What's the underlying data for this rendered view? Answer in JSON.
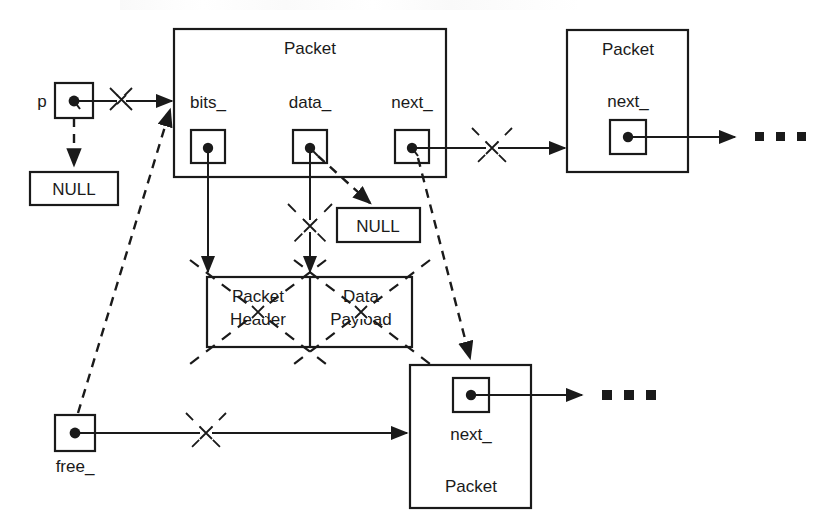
{
  "diagram": {
    "stroke_color": "#1a1a1a",
    "background_color": "#ffffff"
  },
  "labels": {
    "p": "p",
    "null_left": "NULL",
    "null_data": "NULL",
    "free": "free_",
    "packet_main": "Packet",
    "packet_top_right": "Packet",
    "packet_bottom_right": "Packet",
    "bits": "bits_",
    "data": "data_",
    "next_main": "next_",
    "next_top_right": "next_",
    "next_bottom_right": "next_",
    "packet_header_line1": "Packet",
    "packet_header_line2": "Header",
    "data_payload_line1": "Data",
    "data_payload_line2": "Payload"
  },
  "nodes": [
    {
      "id": "p-pointer-box",
      "label": "p",
      "kind": "pointer-cell"
    },
    {
      "id": "null-left-box",
      "label": "NULL",
      "kind": "null-box"
    },
    {
      "id": "null-data-box",
      "label": "NULL",
      "kind": "null-box"
    },
    {
      "id": "free-pointer-box",
      "label": "free_",
      "kind": "pointer-cell"
    },
    {
      "id": "packet-main",
      "label": "Packet",
      "kind": "packet-struct",
      "fields": [
        "bits_",
        "data_",
        "next_"
      ]
    },
    {
      "id": "packet-top-right",
      "label": "Packet",
      "kind": "packet-struct",
      "fields": [
        "next_"
      ]
    },
    {
      "id": "packet-bottom-right",
      "label": "Packet",
      "kind": "packet-struct",
      "fields": [
        "next_"
      ]
    },
    {
      "id": "packet-header-box",
      "label": "Packet Header",
      "kind": "buffer-box",
      "crossed_out": true
    },
    {
      "id": "data-payload-box",
      "label": "Data Payload",
      "kind": "buffer-box",
      "crossed_out": true
    }
  ],
  "edges": [
    {
      "id": "p-to-packet-main",
      "style": "solid",
      "crossed_out": true,
      "from": "p-pointer-box",
      "to": "packet-main"
    },
    {
      "id": "p-to-null",
      "style": "dashed",
      "crossed_out": false,
      "from": "p-pointer-box",
      "to": "null-left-box"
    },
    {
      "id": "bits-to-packet-header",
      "style": "solid",
      "crossed_out": false,
      "from": "bits_",
      "to": "packet-header-box"
    },
    {
      "id": "data-to-data-payload",
      "style": "solid",
      "crossed_out": true,
      "from": "data_",
      "to": "data-payload-box"
    },
    {
      "id": "data-to-null",
      "style": "dashed",
      "crossed_out": false,
      "from": "data_",
      "to": "null-data-box"
    },
    {
      "id": "next-main-to-packet-top",
      "style": "solid",
      "crossed_out": true,
      "from": "next_",
      "to": "packet-top-right"
    },
    {
      "id": "next-main-to-packet-bottom",
      "style": "dashed",
      "crossed_out": false,
      "from": "next_",
      "to": "packet-bottom-right"
    },
    {
      "id": "next-top-to-ellipsis",
      "style": "solid",
      "crossed_out": false,
      "from": "packet-top-right",
      "to": "ellipsis-top"
    },
    {
      "id": "next-bottom-to-ellipsis",
      "style": "solid",
      "crossed_out": false,
      "from": "packet-bottom-right",
      "to": "ellipsis-bottom"
    },
    {
      "id": "free-to-packet-bottom",
      "style": "solid",
      "crossed_out": true,
      "from": "free-pointer-box",
      "to": "packet-bottom-right"
    },
    {
      "id": "free-to-packet-main",
      "style": "dashed",
      "crossed_out": false,
      "from": "free-pointer-box",
      "to": "packet-main"
    }
  ],
  "ellipsis": {
    "top": "▪ ▪ ▪",
    "bottom": "▪ ▪ ▪"
  }
}
